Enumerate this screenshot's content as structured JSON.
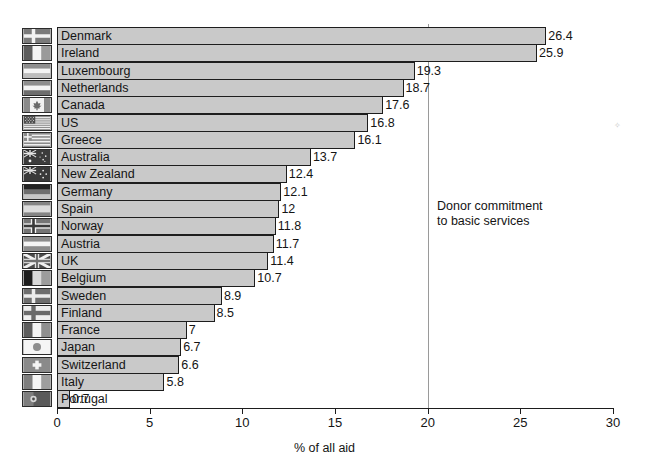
{
  "chart_data": {
    "type": "bar",
    "orientation": "horizontal",
    "title": "",
    "subtitle": "",
    "xlabel": "% of all aid",
    "ylabel": "",
    "xlim": [
      0,
      30
    ],
    "xticks": [
      0,
      5,
      10,
      15,
      20,
      25,
      30
    ],
    "grid": false,
    "legend": null,
    "categories": [
      "Denmark",
      "Ireland",
      "Luxembourg",
      "Netherlands",
      "Canada",
      "US",
      "Greece",
      "Australia",
      "New Zealand",
      "Germany",
      "Spain",
      "Norway",
      "Austria",
      "UK",
      "Belgium",
      "Sweden",
      "Finland",
      "France",
      "Japan",
      "Switzerland",
      "Italy",
      "Portugal"
    ],
    "values": [
      26.4,
      25.9,
      19.3,
      18.7,
      17.6,
      16.8,
      16.1,
      13.7,
      12.4,
      12.1,
      12,
      11.8,
      11.7,
      11.4,
      10.7,
      8.9,
      8.5,
      7,
      6.7,
      6.6,
      5.8,
      0.7
    ],
    "value_labels": [
      "26.4",
      "25.9",
      "19.3",
      "18.7",
      "17.6",
      "16.8",
      "16.1",
      "13.7",
      "12.4",
      "12.1",
      "12",
      "11.8",
      "11.7",
      "11.4",
      "10.7",
      "8.9",
      "8.5",
      "7",
      "6.7",
      "6.6",
      "5.8",
      "0.7"
    ],
    "flags": [
      "flag-denmark",
      "flag-ireland",
      "flag-luxembourg",
      "flag-netherlands",
      "flag-canada",
      "flag-us",
      "flag-greece",
      "flag-australia",
      "flag-new-zealand",
      "flag-germany",
      "flag-spain",
      "flag-norway",
      "flag-austria",
      "flag-uk",
      "flag-belgium",
      "flag-sweden",
      "flag-finland",
      "flag-france",
      "flag-japan",
      "flag-switzerland",
      "flag-italy",
      "flag-portugal"
    ],
    "annotations": [
      {
        "text": "Donor commitment\nto basic services",
        "reference_line_x": 20
      }
    ],
    "colors": {
      "bar_fill": "#c9c9c9",
      "bar_stroke": "#1d1d1d",
      "axis": "#1d1d1d",
      "reference_line": "#9a9a9a",
      "text": "#141414",
      "background": "#ffffff"
    }
  }
}
